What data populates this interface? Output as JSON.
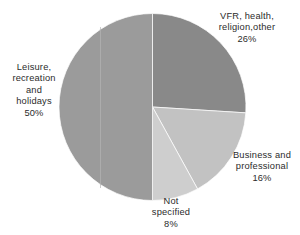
{
  "chart_data": {
    "type": "pie",
    "title": "",
    "subtitle": "",
    "xlabel": "",
    "ylabel": "",
    "legend_position": "none",
    "grid": false,
    "unit": "%",
    "start_angle_deg": 0,
    "direction": "clockwise",
    "categories": [
      "VFR, health, religion,other",
      "Business and professional",
      "Not specified",
      "Leisure, recreation and holidays"
    ],
    "values": [
      26,
      16,
      8,
      50
    ],
    "colors": [
      "#898989",
      "#c2c2c2",
      "#cecece",
      "#9b9b9b"
    ],
    "slices": [
      {
        "name": "VFR, health, religion,other",
        "value": 26,
        "value_label": "26%",
        "color": "#898989",
        "start_deg": 0,
        "end_deg": 93.6
      },
      {
        "name": "Business and professional",
        "value": 16,
        "value_label": "16%",
        "color": "#c2c2c2",
        "start_deg": 93.6,
        "end_deg": 151.2
      },
      {
        "name": "Not specified",
        "value": 8,
        "value_label": "8%",
        "color": "#cecece",
        "start_deg": 151.2,
        "end_deg": 180.0
      },
      {
        "name": "Leisure, recreation and holidays",
        "value": 50,
        "value_label": "50%",
        "color": "#9b9b9b",
        "start_deg": 180.0,
        "end_deg": 360.0
      }
    ]
  },
  "labels": {
    "vfr": "VFR, health,\nreligion,other\n26%",
    "leisure": "Leisure,\nrecreation\nand\nholidays\n50%",
    "business": "Business and\nprofessional\n16%",
    "not_specified": "Not\nspecified\n8%"
  },
  "style": {
    "background": "#ffffff",
    "text_color": "#2b2b2b"
  }
}
